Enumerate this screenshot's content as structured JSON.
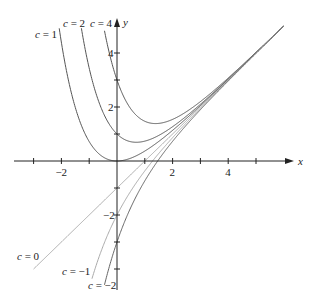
{
  "chart_data": {
    "type": "line",
    "title": "",
    "xlabel": "x",
    "ylabel": "y",
    "xlim": [
      -3.7,
      6.2
    ],
    "ylim": [
      -4.7,
      5.1
    ],
    "x_ticks": [
      -3,
      -2,
      -1,
      1,
      2,
      3,
      4,
      5
    ],
    "x_tick_labels": {
      "-2": "−2",
      "2": "2",
      "4": "4"
    },
    "y_ticks": [
      -4,
      -3,
      -2,
      -1,
      1,
      2,
      3,
      4
    ],
    "y_tick_labels": {
      "-2": "−2",
      "2": "2",
      "4": "4"
    },
    "grid": false,
    "series": [
      {
        "name": "c = 1",
        "c": 1,
        "color": "#555555",
        "x_range": [
          -2.1,
          6.5
        ]
      },
      {
        "name": "c = 2",
        "c": 2,
        "color": "#555555",
        "x_range": [
          -1.3,
          6.5
        ]
      },
      {
        "name": "c = 4",
        "c": 4,
        "color": "#555555",
        "x_range": [
          -0.45,
          6.5
        ]
      },
      {
        "name": "c = 0",
        "c": 0,
        "color": "#aaaaaa",
        "x_range": [
          -3.0,
          6.5
        ]
      },
      {
        "name": "c = −1",
        "c": -1,
        "color": "#aaaaaa",
        "x_range": [
          -0.9,
          6.5
        ]
      },
      {
        "name": "c = −2",
        "c": -2,
        "color": "#666666",
        "x_range": [
          -0.45,
          6.5
        ]
      }
    ],
    "annotations": [
      {
        "text": "c = 1",
        "x": 35,
        "y": 38
      },
      {
        "text": "c = 2",
        "x": 63,
        "y": 27
      },
      {
        "text": "c = 4",
        "x": 90,
        "y": 27
      },
      {
        "text": "c = 0",
        "x": 17,
        "y": 260
      },
      {
        "text": "c = −1",
        "x": 62,
        "y": 275
      },
      {
        "text": "c = −2",
        "x": 88,
        "y": 289
      }
    ]
  },
  "axes": {
    "x_label": "x",
    "y_label": "y"
  }
}
